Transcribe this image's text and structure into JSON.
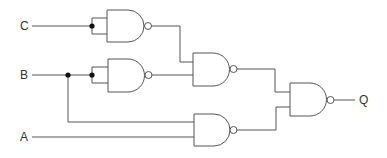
{
  "diagram": {
    "type": "logic-circuit",
    "inputs": [
      {
        "id": "C",
        "label": "C",
        "y": 26
      },
      {
        "id": "B",
        "label": "B",
        "y": 75
      },
      {
        "id": "A",
        "label": "A",
        "y": 137
      }
    ],
    "output": {
      "id": "Q",
      "label": "Q",
      "y": 100
    },
    "gates": [
      {
        "id": "G1",
        "type": "NAND",
        "inputs": [
          "C",
          "C"
        ]
      },
      {
        "id": "G2",
        "type": "NAND",
        "inputs": [
          "B",
          "B"
        ]
      },
      {
        "id": "G3",
        "type": "NAND",
        "inputs": [
          "G1",
          "G2"
        ]
      },
      {
        "id": "G4",
        "type": "NAND",
        "inputs": [
          "B",
          "A"
        ]
      },
      {
        "id": "G5",
        "type": "NAND",
        "inputs": [
          "G3",
          "G4"
        ],
        "output": "Q"
      }
    ],
    "colors": {
      "wire": "#555555",
      "junction": "#111111",
      "background": "#ffffff"
    }
  }
}
